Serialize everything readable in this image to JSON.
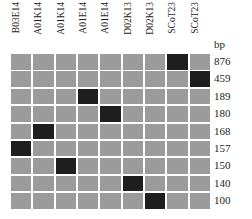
{
  "chart_data": {
    "type": "heatmap",
    "title": "",
    "xlabel": "",
    "ylabel": "bp",
    "grid": false,
    "legend": "none",
    "axis_title_right": "bp",
    "categories": [
      "B03E14",
      "A01K14",
      "A01K14",
      "A01E14",
      "A01E14",
      "D02K13",
      "D02K13",
      "SCoT23",
      "SCoT23"
    ],
    "rows": [
      "876",
      "459",
      "189",
      "180",
      "168",
      "157",
      "150",
      "140",
      "100"
    ],
    "row_label_units": "bp",
    "value_legend": {
      "band_present": 1,
      "band_absent": 0
    },
    "colors": {
      "absent": "#9b9b9b",
      "present": "#1e1e1e",
      "background": "#ffffff",
      "text": "#1d1d1d"
    },
    "values": [
      [
        0,
        0,
        0,
        0,
        0,
        0,
        0,
        1,
        0
      ],
      [
        0,
        0,
        0,
        0,
        0,
        0,
        0,
        0,
        1
      ],
      [
        0,
        0,
        0,
        1,
        0,
        0,
        0,
        0,
        0
      ],
      [
        0,
        0,
        0,
        0,
        1,
        0,
        0,
        0,
        0
      ],
      [
        0,
        1,
        0,
        0,
        0,
        0,
        0,
        0,
        0
      ],
      [
        1,
        0,
        0,
        0,
        0,
        0,
        0,
        0,
        0
      ],
      [
        0,
        0,
        1,
        0,
        0,
        0,
        0,
        0,
        0
      ],
      [
        0,
        0,
        0,
        0,
        0,
        1,
        0,
        0,
        0
      ],
      [
        0,
        0,
        0,
        0,
        0,
        0,
        1,
        0,
        0
      ]
    ]
  }
}
